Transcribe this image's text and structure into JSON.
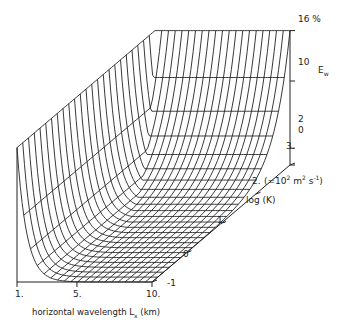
{
  "chart_data": {
    "type": "surface3d",
    "title": "",
    "zlabel": "E_w",
    "zunit": "%",
    "z_ticks": [
      "16 %",
      "10",
      "2",
      "0"
    ],
    "xlabel": "horizontal wavelength L_x (km)",
    "x_ticks": [
      "1.",
      "5.",
      "10."
    ],
    "ylabel": "log (K)",
    "y_unit_note": "(=10² m² s⁻¹)",
    "y_ticks": [
      "-1",
      "0",
      "1.",
      "2.",
      "3."
    ],
    "zlim": [
      0,
      16
    ],
    "xlim": [
      1,
      10
    ],
    "ylim": [
      -1,
      3
    ]
  },
  "labels": {
    "z16": "16 %",
    "z10": "10",
    "z2": "2",
    "z0": "0",
    "ew_main": "E",
    "ew_sub": "w",
    "x1": "1.",
    "x5": "5.",
    "x10": "10.",
    "xlabel_main": "horizontal wavelength  L",
    "xlabel_sub": "x",
    "xlabel_unit": " (km)",
    "ym1": "-1",
    "y0": "0",
    "y1": "1.",
    "y2": "2.",
    "y3": "3.",
    "y_note_pre": "(=10",
    "y_note_sup": "2",
    "y_note_mid": " m",
    "y_note_sup2": "2",
    "y_note_post": " s",
    "y_note_sup3": "-1",
    "y_note_end": ")",
    "ylabel": "log (K)"
  }
}
